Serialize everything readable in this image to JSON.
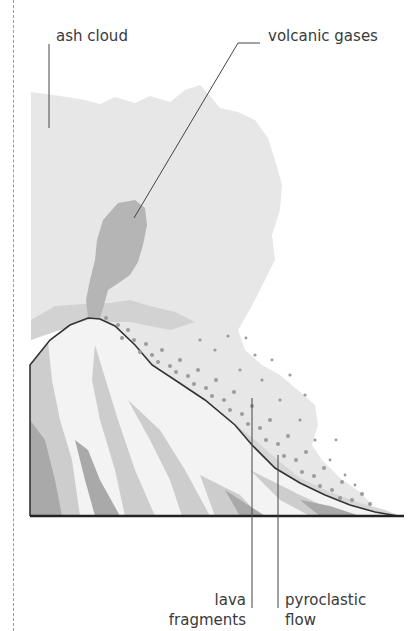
{
  "diagram": {
    "labels": {
      "ash_cloud": "ash cloud",
      "volcanic_gases": "volcanic gases",
      "lava_fragments_line1": "lava",
      "lava_fragments_line2": "fragments",
      "pyroclastic_flow_line1": "pyroclastic",
      "pyroclastic_flow_line2": "flow"
    },
    "colors": {
      "ash_cloud": "#e6e6e6",
      "volcanic_gases": "#b4b4b4",
      "mountain_light": "#f2f2f2",
      "mountain_mid": "#cfcfcf",
      "mountain_dark": "#a8a8a8",
      "pyroclastic_flow": "#d4d4d4",
      "lava_fragments": "#9a9a9a",
      "outline": "#333333"
    }
  }
}
